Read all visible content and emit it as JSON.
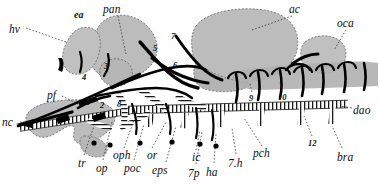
{
  "figure": {
    "type": "anatomical-diagram",
    "palette": {
      "ink": "#111111",
      "organ_fill": "#b9b9b9",
      "organ_fill_light": "#c6c6c6",
      "vessel": "#000000",
      "background": "#ffffff"
    }
  },
  "labels": {
    "abbreviations": [
      {
        "id": "hv",
        "text": "hv",
        "x": 9,
        "y": 24,
        "leader": true
      },
      {
        "id": "ea",
        "text": "ea",
        "x": 74,
        "y": 10,
        "leader": false,
        "bold": true
      },
      {
        "id": "pan",
        "text": "pan",
        "x": 103,
        "y": 4,
        "leader": true
      },
      {
        "id": "ac",
        "text": "ac",
        "x": 289,
        "y": 4,
        "leader": true
      },
      {
        "id": "oca",
        "text": "oca",
        "x": 337,
        "y": 18,
        "leader": true
      },
      {
        "id": "dao",
        "text": "dao",
        "x": 353,
        "y": 105,
        "leader": true
      },
      {
        "id": "nc",
        "text": "nc",
        "x": 2,
        "y": 117,
        "leader": true
      },
      {
        "id": "pf",
        "text": "pf",
        "x": 47,
        "y": 90,
        "leader": true
      },
      {
        "id": "tr",
        "text": "tr",
        "x": 78,
        "y": 158,
        "leader": true
      },
      {
        "id": "op",
        "text": "op",
        "x": 96,
        "y": 163,
        "leader": true
      },
      {
        "id": "oph",
        "text": "oph",
        "x": 113,
        "y": 150,
        "leader": true
      },
      {
        "id": "poc",
        "text": "poc",
        "x": 124,
        "y": 163,
        "leader": true
      },
      {
        "id": "or",
        "text": "or",
        "x": 147,
        "y": 150,
        "leader": true
      },
      {
        "id": "eps",
        "text": "eps",
        "x": 152,
        "y": 165,
        "leader": true
      },
      {
        "id": "ic",
        "text": "ic",
        "x": 192,
        "y": 152,
        "leader": true
      },
      {
        "id": "7p",
        "text": "7p",
        "x": 188,
        "y": 168,
        "leader": true
      },
      {
        "id": "ha",
        "text": "ha",
        "x": 206,
        "y": 167,
        "leader": true
      },
      {
        "id": "7h",
        "text": "7.h",
        "x": 228,
        "y": 158,
        "leader": true
      },
      {
        "id": "pch",
        "text": "pch",
        "x": 253,
        "y": 148,
        "leader": true
      },
      {
        "id": "bra",
        "text": "bra",
        "x": 337,
        "y": 152,
        "leader": true
      }
    ],
    "numbers": [
      {
        "id": "n1",
        "text": "1",
        "x": 86,
        "y": 98
      },
      {
        "id": "n2",
        "text": "2",
        "x": 100,
        "y": 101
      },
      {
        "id": "n3",
        "text": "3",
        "x": 104,
        "y": 62
      },
      {
        "id": "n4",
        "text": "4",
        "x": 82,
        "y": 73
      },
      {
        "id": "n5",
        "text": "5",
        "x": 153,
        "y": 44
      },
      {
        "id": "n6",
        "text": "6",
        "x": 173,
        "y": 61
      },
      {
        "id": "n7",
        "text": "7",
        "x": 171,
        "y": 32
      },
      {
        "id": "n8",
        "text": "8",
        "x": 117,
        "y": 100
      },
      {
        "id": "n9",
        "text": "9",
        "x": 249,
        "y": 94
      },
      {
        "id": "n10",
        "text": "10",
        "x": 278,
        "y": 93
      },
      {
        "id": "n12",
        "text": "12",
        "x": 308,
        "y": 139
      }
    ]
  }
}
